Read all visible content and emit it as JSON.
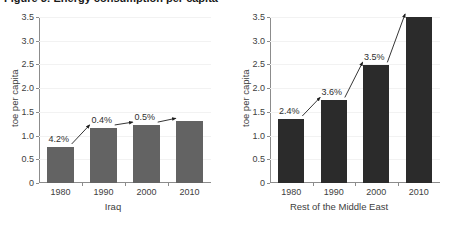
{
  "figure": {
    "title_cutoff": "Figure 3: Energy consumption per capita"
  },
  "chart_data": [
    {
      "type": "bar",
      "title": "Iraq",
      "xlabel": "Iraq",
      "ylabel": "toe per capita",
      "categories": [
        "1980",
        "1990",
        "2000",
        "2010"
      ],
      "values": [
        0.76,
        1.16,
        1.22,
        1.3
      ],
      "ylim": [
        0,
        3.5
      ],
      "yticks": [
        "0",
        "0.5",
        "1.0",
        "1.5",
        "2.0",
        "2.5",
        "3.0",
        "3.5"
      ],
      "ytick_values": [
        0,
        0.5,
        1.0,
        1.5,
        2.0,
        2.5,
        3.0,
        3.5
      ],
      "grid": true,
      "legend": "none",
      "bar_color": "#636363",
      "annotations": [
        {
          "label": "4.2%",
          "from": "1980",
          "to": "1990"
        },
        {
          "label": "0.4%",
          "from": "1990",
          "to": "2000"
        },
        {
          "label": "0.5%",
          "from": "2000",
          "to": "2010"
        }
      ]
    },
    {
      "type": "bar",
      "title": "Rest of the Middle East",
      "xlabel": "Rest of the Middle East",
      "ylabel": "toe per capita",
      "categories": [
        "1980",
        "1990",
        "2000",
        "2010"
      ],
      "values": [
        1.35,
        1.74,
        2.48,
        3.5
      ],
      "ylim": [
        0,
        3.5
      ],
      "yticks": [
        "0",
        "0.5",
        "1.0",
        "1.5",
        "2.0",
        "2.5",
        "3.0",
        "3.5"
      ],
      "ytick_values": [
        0,
        0.5,
        1.0,
        1.5,
        2.0,
        2.5,
        3.0,
        3.5
      ],
      "grid": true,
      "legend": "none",
      "bar_color": "#2b2b2b",
      "annotations": [
        {
          "label": "2.4%",
          "from": "1980",
          "to": "1990"
        },
        {
          "label": "3.6%",
          "from": "1990",
          "to": "2000"
        },
        {
          "label": "3.5%",
          "from": "2000",
          "to": "2010"
        }
      ]
    }
  ]
}
